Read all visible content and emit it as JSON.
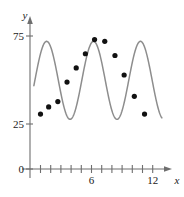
{
  "figure": {
    "caption_fragment": "",
    "background": "#ffffff",
    "curve_color": "#8d8d8d",
    "point_color": "#111111",
    "axis_color": "#6e6e6e"
  },
  "axes": {
    "y_axis_label": "y",
    "x_axis_label": "x",
    "y_ticks_labeled": [
      "75",
      "25",
      "0"
    ],
    "x_ticks_labeled": [
      "6",
      "12"
    ]
  },
  "chart_data": {
    "type": "scatter",
    "title": "",
    "subtitle": "",
    "xlabel": "x",
    "ylabel": "y",
    "xlim": [
      0,
      13.6
    ],
    "ylim": [
      0,
      88
    ],
    "grid": false,
    "legend": null,
    "x_tick_values": [
      1,
      2,
      3,
      4,
      5,
      6,
      7,
      8,
      9,
      10,
      11,
      12,
      13
    ],
    "x_tick_labels": {
      "6": "6",
      "12": "12"
    },
    "y_tick_values": [
      0,
      25,
      75
    ],
    "y_tick_labels": {
      "0": "0",
      "25": "25",
      "75": "75"
    },
    "series": [
      {
        "name": "data points",
        "type": "scatter",
        "marker": "filled-circle",
        "color": "#111111",
        "points": [
          {
            "x": 1.0,
            "y": 31
          },
          {
            "x": 1.8,
            "y": 35
          },
          {
            "x": 2.7,
            "y": 38
          },
          {
            "x": 3.6,
            "y": 49
          },
          {
            "x": 4.5,
            "y": 57
          },
          {
            "x": 5.4,
            "y": 65
          },
          {
            "x": 6.3,
            "y": 73
          },
          {
            "x": 7.3,
            "y": 72
          },
          {
            "x": 8.3,
            "y": 64
          },
          {
            "x": 9.2,
            "y": 53
          },
          {
            "x": 10.2,
            "y": 41
          },
          {
            "x": 11.2,
            "y": 31
          }
        ]
      },
      {
        "name": "fitted sinusoid",
        "type": "line",
        "color": "#8d8d8d",
        "model": "sinusoidal",
        "midline": 50,
        "amplitude": 22,
        "period": 4.6,
        "phase_first_peak_x": 1.6,
        "x_start": 0.35,
        "x_end": 12.9
      }
    ]
  }
}
